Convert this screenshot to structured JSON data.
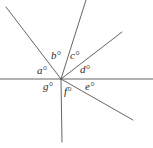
{
  "figure": {
    "type": "geometry-angle-diagram",
    "background_color": "#ffffff",
    "line_color": "#555555",
    "label_color": "#2b2b2b",
    "width": 153,
    "height": 148,
    "vertex": {
      "x": 61,
      "y": 79
    },
    "rays": [
      {
        "name": "ray-horizontal-left",
        "x1": 61,
        "y1": 79,
        "x2": 0,
        "y2": 79
      },
      {
        "name": "ray-upper-left",
        "x1": 61,
        "y1": 79,
        "x2": 6,
        "y2": 7
      },
      {
        "name": "ray-steep-up",
        "x1": 61,
        "y1": 79,
        "x2": 86,
        "y2": 0
      },
      {
        "name": "ray-upper-right",
        "x1": 61,
        "y1": 79,
        "x2": 122,
        "y2": 32
      },
      {
        "name": "ray-horizontal-right",
        "x1": 61,
        "y1": 79,
        "x2": 153,
        "y2": 79
      },
      {
        "name": "ray-lower-right",
        "x1": 61,
        "y1": 79,
        "x2": 133,
        "y2": 120
      },
      {
        "name": "ray-vertical-down",
        "x1": 61,
        "y1": 79,
        "x2": 62,
        "y2": 142
      }
    ],
    "labels": [
      {
        "name": "angle-label-a",
        "text": "a°",
        "x": 37,
        "y": 65
      },
      {
        "name": "angle-label-b",
        "text": "b°",
        "x": 51,
        "y": 50
      },
      {
        "name": "angle-label-c",
        "text": "c°",
        "x": 70,
        "y": 50
      },
      {
        "name": "angle-label-d",
        "text": "d°",
        "x": 80,
        "y": 64
      },
      {
        "name": "angle-label-e",
        "text": "e°",
        "x": 85,
        "y": 81
      },
      {
        "name": "angle-label-f",
        "text": "f°",
        "x": 64,
        "y": 86
      },
      {
        "name": "angle-label-g",
        "text": "g°",
        "x": 43,
        "y": 81
      }
    ]
  }
}
